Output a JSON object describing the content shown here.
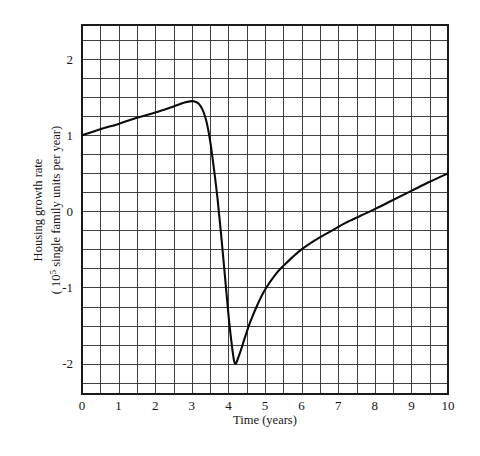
{
  "chart_data": {
    "type": "line",
    "title": "",
    "xlabel": "Time  (years)",
    "ylabel_line1": "Housing growth rate",
    "ylabel_line2_prefix": "( 10",
    "ylabel_line2_sup": "5",
    "ylabel_line2_suffix": " single family units per year)",
    "xlim": [
      0,
      10
    ],
    "ylim": [
      -2.4,
      2.45
    ],
    "xticks": [
      0,
      1,
      2,
      3,
      4,
      5,
      6,
      7,
      8,
      9,
      10
    ],
    "xtick_labels": [
      "0",
      "1",
      "2",
      "3",
      "4",
      "5",
      "6",
      "7",
      "8",
      "9",
      "10"
    ],
    "yticks": [
      2,
      1,
      0,
      -1,
      -2
    ],
    "ytick_labels": [
      "2",
      "1",
      "0",
      "-1",
      "-2"
    ],
    "grid": true,
    "grid_minor_x_step": 0.5,
    "grid_minor_y_step": 0.25,
    "legend": "none",
    "series": [
      {
        "name": "Housing growth rate",
        "color": "#0b0b0b",
        "x": [
          0.0,
          0.5,
          1.0,
          1.5,
          2.0,
          2.5,
          2.8,
          3.0,
          3.1,
          3.2,
          3.3,
          3.4,
          3.5,
          3.6,
          3.7,
          3.8,
          3.9,
          4.0,
          4.1,
          4.18,
          4.3,
          4.45,
          4.6,
          4.8,
          5.0,
          5.3,
          5.6,
          6.0,
          6.4,
          6.8,
          7.2,
          7.6,
          8.0,
          8.5,
          9.0,
          9.5,
          10.0
        ],
        "y": [
          1.0,
          1.08,
          1.15,
          1.23,
          1.3,
          1.38,
          1.43,
          1.45,
          1.44,
          1.41,
          1.33,
          1.18,
          0.93,
          0.58,
          0.18,
          -0.3,
          -0.82,
          -1.35,
          -1.78,
          -2.0,
          -1.88,
          -1.66,
          -1.45,
          -1.22,
          -1.03,
          -0.82,
          -0.67,
          -0.5,
          -0.37,
          -0.26,
          -0.15,
          -0.06,
          0.03,
          0.15,
          0.27,
          0.39,
          0.5
        ]
      }
    ],
    "annotations": {
      "peak_value": 1.45,
      "peak_time": 3.0,
      "trough_value": -2.0,
      "trough_time": 4.18,
      "start_value": 1.0,
      "end_value": 0.5
    }
  }
}
